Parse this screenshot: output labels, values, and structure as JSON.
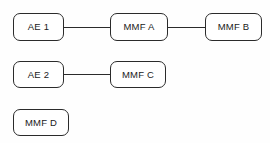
{
  "diagram": {
    "type": "block-diagram",
    "background_color": "#fefefe",
    "line_color": "#2b2b2b",
    "node_fill": "#ffffff",
    "nodes": [
      {
        "id": "ae-1",
        "label": "AE 1",
        "x": 13,
        "y": 13,
        "width": 51,
        "height": 28,
        "row": 1
      },
      {
        "id": "mmf-a",
        "label": "MMF A",
        "x": 110,
        "y": 13,
        "width": 58,
        "height": 28,
        "row": 1
      },
      {
        "id": "mmf-b",
        "label": "MMF B",
        "x": 205,
        "y": 13,
        "width": 57,
        "height": 28,
        "row": 1
      },
      {
        "id": "ae-2",
        "label": "AE 2",
        "x": 13,
        "y": 61,
        "width": 51,
        "height": 27,
        "row": 2
      },
      {
        "id": "mmf-c",
        "label": "MMF C",
        "x": 110,
        "y": 61,
        "width": 56,
        "height": 27,
        "row": 2
      },
      {
        "id": "mmf-d",
        "label": "MMF D",
        "x": 13,
        "y": 109,
        "width": 56,
        "height": 27,
        "row": 3
      }
    ],
    "edges": [
      {
        "id": "edge-ae1-mmfa",
        "from": "ae-1",
        "to": "mmf-a",
        "x": 64,
        "y": 27,
        "length": 46
      },
      {
        "id": "edge-mmfa-mmfb",
        "from": "mmf-a",
        "to": "mmf-b",
        "x": 168,
        "y": 27,
        "length": 37
      },
      {
        "id": "edge-ae2-mmfc",
        "from": "ae-2",
        "to": "mmf-c",
        "x": 64,
        "y": 74,
        "length": 46
      }
    ]
  }
}
